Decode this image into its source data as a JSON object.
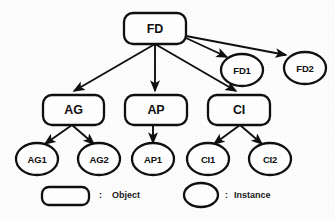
{
  "diagram": {
    "type": "tree",
    "stroke_color": "#101010",
    "fill_color": "#ffffff",
    "background_color": "#fdfdfd",
    "objects": [
      {
        "id": "FD",
        "label": "FD",
        "shape": "rounded-rect",
        "x": 124,
        "y": 13,
        "w": 62,
        "h": 31
      },
      {
        "id": "AG",
        "label": "AG",
        "shape": "rounded-rect",
        "x": 43,
        "y": 95,
        "w": 61,
        "h": 30
      },
      {
        "id": "AP",
        "label": "AP",
        "shape": "rounded-rect",
        "x": 125,
        "y": 95,
        "w": 62,
        "h": 30
      },
      {
        "id": "CI",
        "label": "CI",
        "shape": "rounded-rect",
        "x": 208,
        "y": 95,
        "w": 62,
        "h": 30
      }
    ],
    "instances": [
      {
        "id": "FD1",
        "label": "FD1",
        "shape": "ellipse",
        "cx": 242,
        "cy": 70,
        "rx": 21,
        "ry": 16
      },
      {
        "id": "FD2",
        "label": "FD2",
        "shape": "ellipse",
        "cx": 305,
        "cy": 68,
        "rx": 21,
        "ry": 16
      },
      {
        "id": "AG1",
        "label": "AG1",
        "shape": "ellipse",
        "cx": 37,
        "cy": 159,
        "rx": 21,
        "ry": 16
      },
      {
        "id": "AG2",
        "label": "AG2",
        "shape": "ellipse",
        "cx": 99,
        "cy": 159,
        "rx": 21,
        "ry": 16
      },
      {
        "id": "AP1",
        "label": "AP1",
        "shape": "ellipse",
        "cx": 153,
        "cy": 159,
        "rx": 21,
        "ry": 16
      },
      {
        "id": "CI1",
        "label": "CI1",
        "shape": "ellipse",
        "cx": 208,
        "cy": 159,
        "rx": 21,
        "ry": 16
      },
      {
        "id": "CI2",
        "label": "CI2",
        "shape": "ellipse",
        "cx": 270,
        "cy": 159,
        "rx": 21,
        "ry": 16
      }
    ],
    "edges": [
      {
        "from": "FD",
        "to": "AG",
        "kind": "object-to-object",
        "x1": 155,
        "y1": 44,
        "x2": 72,
        "y2": 93
      },
      {
        "from": "FD",
        "to": "AP",
        "kind": "object-to-object",
        "x1": 155,
        "y1": 44,
        "x2": 155,
        "y2": 93
      },
      {
        "from": "FD",
        "to": "CI",
        "kind": "object-to-object",
        "x1": 155,
        "y1": 44,
        "x2": 238,
        "y2": 93
      },
      {
        "from": "FD",
        "to": "FD1",
        "kind": "object-to-instance",
        "x1": 186,
        "y1": 38,
        "x2": 228,
        "y2": 58
      },
      {
        "from": "FD",
        "to": "FD2",
        "kind": "object-to-instance",
        "x1": 186,
        "y1": 36,
        "x2": 287,
        "y2": 56
      },
      {
        "from": "AG",
        "to": "AG1",
        "kind": "object-to-instance",
        "x1": 72,
        "y1": 125,
        "x2": 44,
        "y2": 145
      },
      {
        "from": "AG",
        "to": "AG2",
        "kind": "object-to-instance",
        "x1": 72,
        "y1": 125,
        "x2": 95,
        "y2": 145
      },
      {
        "from": "AP",
        "to": "AP1",
        "kind": "object-to-instance",
        "x1": 153,
        "y1": 125,
        "x2": 153,
        "y2": 144
      },
      {
        "from": "CI",
        "to": "CI1",
        "kind": "object-to-instance",
        "x1": 240,
        "y1": 125,
        "x2": 213,
        "y2": 145
      },
      {
        "from": "CI",
        "to": "CI2",
        "kind": "object-to-instance",
        "x1": 240,
        "y1": 125,
        "x2": 263,
        "y2": 145
      }
    ]
  },
  "legend": {
    "object": {
      "separator": ":",
      "label": "Object",
      "swatch_shape": "rounded-rect",
      "swatch": {
        "x": 42,
        "y": 187,
        "w": 47,
        "h": 18
      },
      "separator_x": 99,
      "label_x": 112,
      "text_y": 190
    },
    "instance": {
      "separator": ":",
      "label": "Instance",
      "swatch_shape": "ellipse",
      "swatch": {
        "cx": 201,
        "cy": 195,
        "rx": 17,
        "ry": 12
      },
      "separator_x": 225,
      "label_x": 234,
      "text_y": 190
    }
  }
}
